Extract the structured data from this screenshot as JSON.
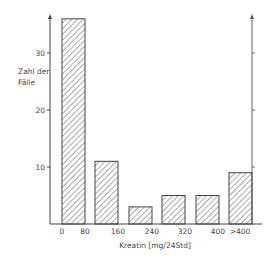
{
  "chart_data": {
    "type": "bar",
    "title": "",
    "xlabel": "Kreatin [mg/24Std]",
    "ylabel": "Zahl der Fälle",
    "ylabel_lines": [
      "Zahl der",
      "Fälle"
    ],
    "x_tick_labels": [
      "0",
      "80",
      "160",
      "240",
      "320",
      "400",
      ">400"
    ],
    "categories": [
      "0-80",
      "80-160",
      "160-240",
      "240-320",
      "320-400",
      ">400"
    ],
    "values": [
      36,
      11,
      3,
      5,
      5,
      9
    ],
    "y_ticks": [
      10,
      20,
      30
    ],
    "y_tick_labels": [
      "10",
      "20",
      "30"
    ],
    "ylim": [
      0,
      37
    ],
    "grid": false,
    "legend": null,
    "bar_fill": "diagonal hatch",
    "colors": {
      "line": "#444444",
      "hatch": "#555555",
      "background": "#ffffff"
    }
  }
}
